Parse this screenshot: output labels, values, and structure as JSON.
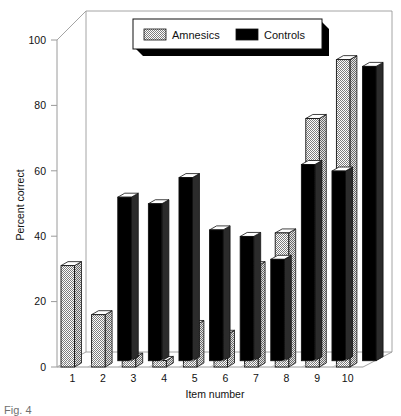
{
  "chart_data": {
    "type": "bar",
    "title": "",
    "xlabel": "Item number",
    "ylabel": "Percent correct",
    "categories": [
      "1",
      "2",
      "3",
      "4",
      "5",
      "6",
      "7",
      "8",
      "9",
      "10"
    ],
    "series": [
      {
        "name": "Amnesics",
        "values": [
          31,
          16,
          3,
          2,
          13,
          10,
          31,
          41,
          76,
          94
        ],
        "color": "#b3b3b3"
      },
      {
        "name": "Controls",
        "values": [
          0,
          50,
          48,
          56,
          40,
          38,
          31,
          60,
          58,
          90
        ],
        "color": "#000000"
      }
    ],
    "ylim": [
      0,
      100
    ],
    "yticks": [
      0,
      20,
      40,
      60,
      80,
      100
    ],
    "ytick_labels": [
      "0",
      "20",
      "40",
      "60",
      "80",
      "100"
    ],
    "grid": false,
    "legend_position": "top-center",
    "style": "3d-extruded-bars"
  },
  "legend": {
    "entries": [
      {
        "label": "Amnesics",
        "swatch": "hatched-gray"
      },
      {
        "label": "Controls",
        "swatch": "solid-black"
      }
    ]
  },
  "axes": {
    "y_title": "Percent correct",
    "x_title": "Item number"
  },
  "caption": {
    "text": "Fig. 4"
  },
  "colors": {
    "amnesics_fill": "#b3b3b3",
    "controls_fill": "#000000",
    "outline": "#111111",
    "highlight": "#ffffff",
    "background": "#ffffff",
    "frame": "#8a8a8a"
  }
}
